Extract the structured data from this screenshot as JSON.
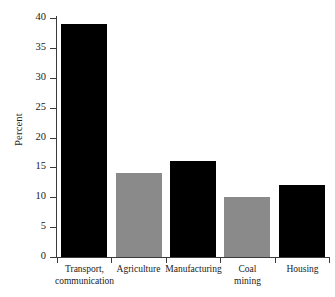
{
  "chart_data": {
    "type": "bar",
    "title": "",
    "subtitle": "",
    "xlabel": "",
    "ylabel": "Percent",
    "categories": [
      "Transport, communication",
      "Agriculture",
      "Manufacturing",
      "Coal mining",
      "Housing"
    ],
    "category_lines": [
      [
        "Transport,",
        "communication"
      ],
      [
        "Agriculture",
        ""
      ],
      [
        "Manufacturing",
        ""
      ],
      [
        "Coal",
        "mining"
      ],
      [
        "Housing",
        ""
      ]
    ],
    "values": [
      39,
      14,
      16,
      10,
      12
    ],
    "bar_colors": [
      "#000000",
      "#8a8a8a",
      "#000000",
      "#8a8a8a",
      "#000000"
    ],
    "ylim": [
      0,
      40
    ],
    "ytick_values": [
      0,
      5,
      10,
      15,
      20,
      25,
      30,
      35,
      40
    ],
    "ytick_labels": [
      "0",
      "5",
      "10",
      "15",
      "20",
      "25",
      "30",
      "35",
      "40"
    ],
    "grid": false,
    "legend": null,
    "annotations": [],
    "background_color": "#ffffff",
    "axis_color": "#3a3a3a"
  }
}
